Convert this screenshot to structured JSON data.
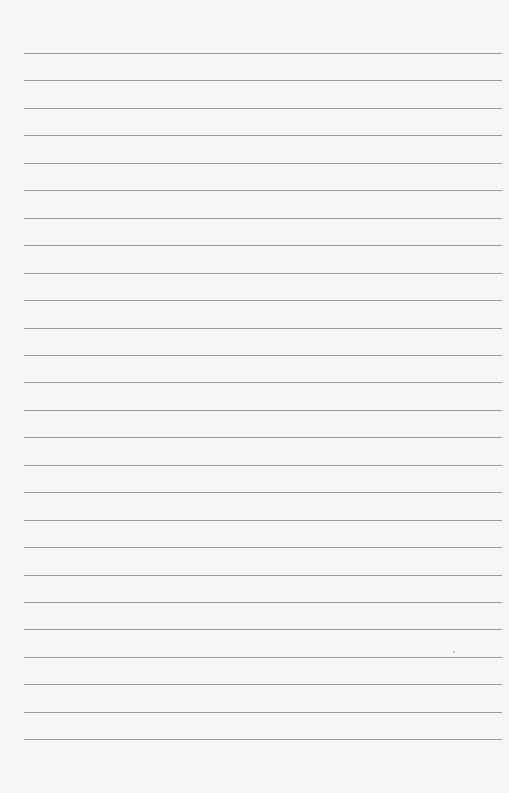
{
  "page": {
    "type": "lined-paper",
    "background_color": "#f7f7f6",
    "rule_color": "#9c9c9c",
    "rule_count": 26,
    "rule_start_y": 53,
    "rule_spacing": 27.45,
    "rule_left": 24,
    "rule_right": 502,
    "text": ""
  }
}
